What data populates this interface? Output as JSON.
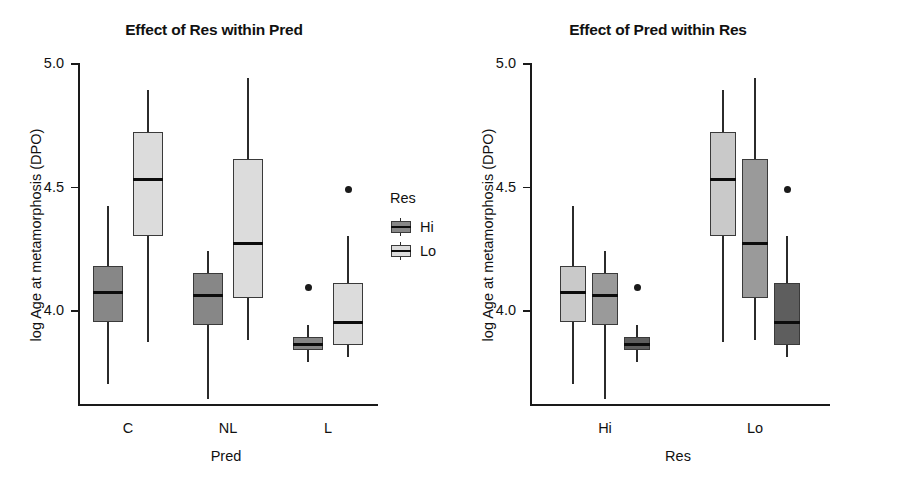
{
  "chart_data": [
    {
      "type": "box",
      "title": "Effect of Res within Pred",
      "xlabel": "Pred",
      "ylabel": "log Age at metamorphosis (DPO)",
      "categories": [
        "C",
        "NL",
        "L"
      ],
      "ylim": [
        3.62,
        5.0
      ],
      "yticks": [
        5.0,
        4.5,
        4.0
      ],
      "ytick_labels": [
        "5.0",
        "4.5",
        "4.0"
      ],
      "grid": false,
      "legend": {
        "title": "Res",
        "position": "right",
        "entries": [
          {
            "label": "Hi",
            "color": "#878787"
          },
          {
            "label": "Lo",
            "color": "#dcdcdc"
          }
        ]
      },
      "series": [
        {
          "name": "Hi",
          "color": "#878787",
          "boxes": [
            {
              "category": "C",
              "min": 3.7,
              "q1": 3.95,
              "median": 4.07,
              "q3": 4.18,
              "max": 4.42,
              "outliers": []
            },
            {
              "category": "NL",
              "min": 3.64,
              "q1": 3.94,
              "median": 4.06,
              "q3": 4.15,
              "max": 4.24,
              "outliers": []
            },
            {
              "category": "L",
              "min": 3.79,
              "q1": 3.84,
              "median": 3.86,
              "q3": 3.89,
              "max": 3.94,
              "outliers": [
                4.09
              ]
            }
          ]
        },
        {
          "name": "Lo",
          "color": "#dcdcdc",
          "boxes": [
            {
              "category": "C",
              "min": 3.87,
              "q1": 4.3,
              "median": 4.53,
              "q3": 4.72,
              "max": 4.89,
              "outliers": []
            },
            {
              "category": "NL",
              "min": 3.88,
              "q1": 4.05,
              "median": 4.27,
              "q3": 4.61,
              "max": 4.94,
              "outliers": []
            },
            {
              "category": "L",
              "min": 3.81,
              "q1": 3.86,
              "median": 3.95,
              "q3": 4.11,
              "max": 4.3,
              "outliers": [
                4.49
              ]
            }
          ]
        }
      ]
    },
    {
      "type": "box",
      "title": "Effect of Pred within Res",
      "xlabel": "Res",
      "ylabel": "log Age at metamorphosis (DPO)",
      "categories": [
        "Hi",
        "Lo"
      ],
      "ylim": [
        3.62,
        5.0
      ],
      "yticks": [
        5.0,
        4.5,
        4.0
      ],
      "ytick_labels": [
        "5.0",
        "4.5",
        "4.0"
      ],
      "grid": false,
      "legend": {
        "title": "Pred",
        "position": "right",
        "entries": [
          {
            "label": "C",
            "color": "#c9c9c9"
          },
          {
            "label": "NL",
            "color": "#9a9a9a"
          },
          {
            "label": "L",
            "color": "#5e5e5e"
          }
        ]
      },
      "series": [
        {
          "name": "C",
          "color": "#c9c9c9",
          "boxes": [
            {
              "category": "Hi",
              "min": 3.7,
              "q1": 3.95,
              "median": 4.07,
              "q3": 4.18,
              "max": 4.42,
              "outliers": []
            },
            {
              "category": "Lo",
              "min": 3.87,
              "q1": 4.3,
              "median": 4.53,
              "q3": 4.72,
              "max": 4.89,
              "outliers": []
            }
          ]
        },
        {
          "name": "NL",
          "color": "#9a9a9a",
          "boxes": [
            {
              "category": "Hi",
              "min": 3.64,
              "q1": 3.94,
              "median": 4.06,
              "q3": 4.15,
              "max": 4.24,
              "outliers": []
            },
            {
              "category": "Lo",
              "min": 3.88,
              "q1": 4.05,
              "median": 4.27,
              "q3": 4.61,
              "max": 4.94,
              "outliers": []
            }
          ]
        },
        {
          "name": "L",
          "color": "#5e5e5e",
          "boxes": [
            {
              "category": "Hi",
              "min": 3.79,
              "q1": 3.84,
              "median": 3.86,
              "q3": 3.89,
              "max": 3.94,
              "outliers": [
                4.09
              ]
            },
            {
              "category": "Lo",
              "min": 3.81,
              "q1": 3.86,
              "median": 3.95,
              "q3": 4.11,
              "max": 4.3,
              "outliers": [
                4.49
              ]
            }
          ]
        }
      ]
    }
  ]
}
